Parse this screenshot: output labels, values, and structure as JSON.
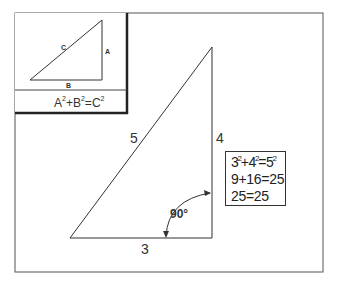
{
  "diagram": {
    "inset": {
      "side_labels": {
        "hypotenuse": "C",
        "vertical": "A",
        "base": "B"
      },
      "formula": {
        "terms": [
          "A",
          "B",
          "C"
        ],
        "exponent": "2",
        "ops": [
          "+",
          "="
        ]
      }
    },
    "main_triangle": {
      "hypotenuse_label": "5",
      "vertical_label": "4",
      "base_label": "3",
      "angle_label": "90°"
    },
    "equations": {
      "line1": {
        "a": "3",
        "b": "4",
        "c": "5",
        "exp": "2",
        "op1": "+",
        "op2": "="
      },
      "line2": "9+16=25",
      "line3": "25=25"
    },
    "colors": {
      "line": "#333333",
      "frame": "#555555",
      "background": "#ffffff"
    }
  }
}
